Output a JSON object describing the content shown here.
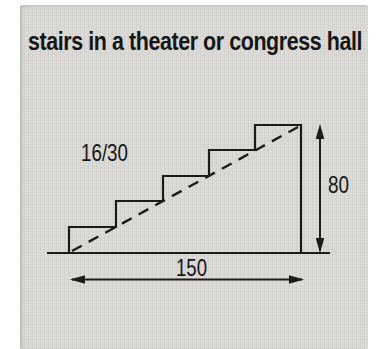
{
  "title": "stairs in a theater or congress hall",
  "diagram": {
    "labels": {
      "ratio": "16/30",
      "height": "80",
      "length": "150"
    },
    "stairs": {
      "step_count": 5,
      "riser_tread_ratio": "16/30",
      "total_height": "80",
      "total_run": "150"
    },
    "colors": {
      "paper": "#dbdad6",
      "ink": "#1b1b1b",
      "background": "#ffffff"
    }
  }
}
